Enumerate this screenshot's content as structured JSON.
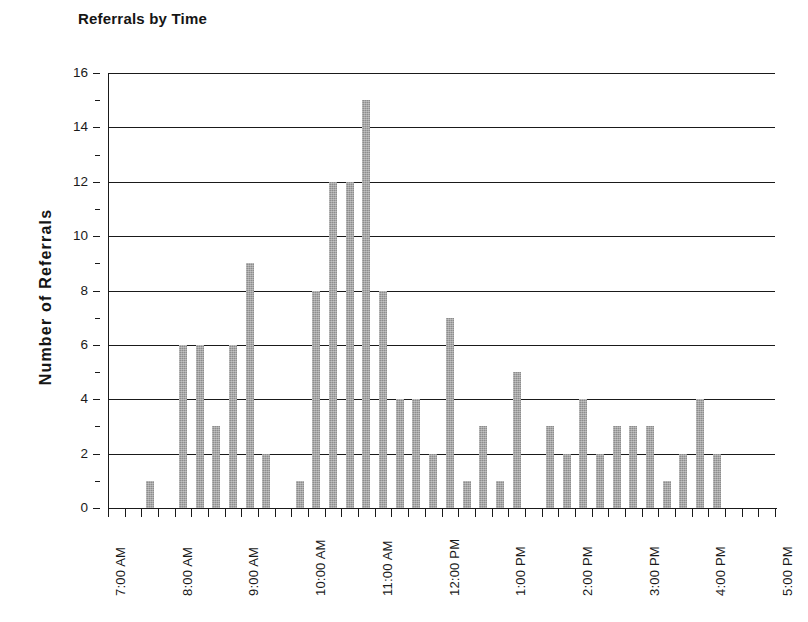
{
  "chart_data": {
    "type": "bar",
    "title": "Referrals by Time",
    "xlabel": "",
    "ylabel": "Number of Referrals",
    "ylim": [
      0,
      16
    ],
    "ytick_step": 2,
    "yminor_step": 1,
    "grid": "horizontal",
    "legend": "none",
    "bar_color": "#8d8d8d",
    "axis_color": "#1a1a1a",
    "xlim": [
      "7:00 AM",
      "5:00 PM"
    ],
    "x_tick_interval_minutes": 15,
    "ytick_labels": [
      "0",
      "2",
      "4",
      "6",
      "8",
      "10",
      "12",
      "14",
      "16"
    ],
    "xtick_labels": [
      "7:00 AM",
      "8:00 AM",
      "9:00 AM",
      "10:00 AM",
      "11:00 AM",
      "12:00 PM",
      "1:00 PM",
      "2:00 PM",
      "3:00 PM",
      "4:00 PM",
      "5:00 PM"
    ],
    "categories": [
      "7:00 AM",
      "7:15 AM",
      "7:30 AM",
      "7:45 AM",
      "8:00 AM",
      "8:15 AM",
      "8:30 AM",
      "8:45 AM",
      "9:00 AM",
      "9:15 AM",
      "9:30 AM",
      "9:45 AM",
      "10:00 AM",
      "10:15 AM",
      "10:30 AM",
      "10:45 AM",
      "11:00 AM",
      "11:15 AM",
      "11:30 AM",
      "11:45 AM",
      "12:00 PM",
      "12:15 PM",
      "12:30 PM",
      "12:45 PM",
      "1:00 PM",
      "1:15 PM",
      "1:30 PM",
      "1:45 PM",
      "2:00 PM",
      "2:15 PM",
      "2:30 PM",
      "2:45 PM",
      "3:00 PM",
      "3:15 PM",
      "3:30 PM",
      "3:45 PM",
      "4:00 PM",
      "4:15 PM",
      "4:30 PM",
      "4:45 PM",
      "5:00 PM"
    ],
    "values": [
      0,
      0,
      1,
      0,
      6,
      6,
      3,
      6,
      9,
      2,
      0,
      1,
      8,
      12,
      12,
      15,
      8,
      4,
      4,
      2,
      7,
      1,
      3,
      1,
      5,
      0,
      3,
      2,
      4,
      2,
      3,
      3,
      3,
      1,
      2,
      4,
      2,
      0,
      0,
      0,
      0
    ]
  }
}
